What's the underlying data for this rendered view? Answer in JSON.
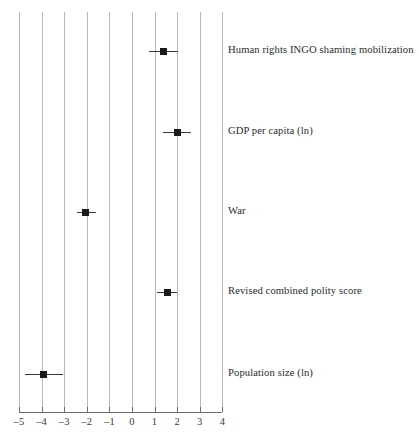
{
  "chart_data": {
    "type": "scatter",
    "title": "",
    "subtitle": "",
    "xlabel": "",
    "ylabel": "",
    "xlim": [
      -5,
      4
    ],
    "grid": true,
    "grid_orientation": "vertical",
    "legend": "none",
    "orientation": "horizontal",
    "marker": "filled-square",
    "error_bars": "horizontal",
    "xticks": [
      -5,
      -4,
      -3,
      -2,
      -1,
      0,
      1,
      2,
      3,
      4
    ],
    "xticklabels": [
      "–5",
      "–4",
      "–3",
      "–2",
      "–1",
      "0",
      "1",
      "2",
      "3",
      "4"
    ],
    "categories": [
      "Human rights INGO shaming mobilization",
      "GDP per capita (ln)",
      "War",
      "Revised combined polity score",
      "Population size (ln)"
    ],
    "points": [
      {
        "label": "Human rights INGO shaming mobilization",
        "estimate": 1.4,
        "ci_low": 0.75,
        "ci_high": 2.05,
        "y_pixel": 51
      },
      {
        "label": "GDP per capita (ln)",
        "estimate": 2.0,
        "ci_low": 1.35,
        "ci_high": 2.6,
        "y_pixel": 132
      },
      {
        "label": "War",
        "estimate": -2.05,
        "ci_low": -2.45,
        "ci_high": -1.6,
        "y_pixel": 212
      },
      {
        "label": "Revised combined polity score",
        "estimate": 1.55,
        "ci_low": 1.1,
        "ci_high": 2.0,
        "y_pixel": 292
      },
      {
        "label": "Population size (ln)",
        "estimate": -3.9,
        "ci_low": -4.75,
        "ci_high": -3.05,
        "y_pixel": 374
      }
    ]
  },
  "axis": {
    "x_start_px": 19,
    "x_end_px": 222,
    "px_per_unit": 22.6,
    "baseline_y_px": 412,
    "grid_top_px": 12,
    "grid_bottom_px": 409
  }
}
